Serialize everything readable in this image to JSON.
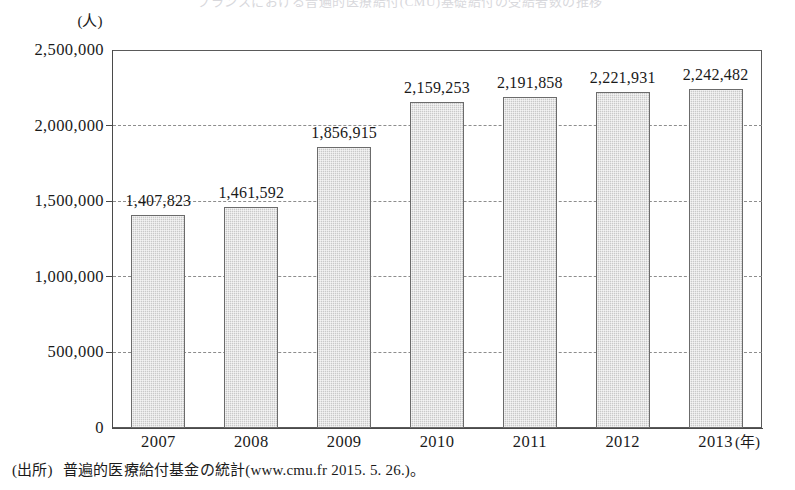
{
  "figure": {
    "title_cut_off": "フランスにおける普遍的医療給付(CMU)基礎給付の受給者数の推移",
    "y_unit_label": "(人)",
    "x_unit_label": "(年)",
    "source_note": {
      "label": "(出所)",
      "text": "普遍的医療給付基金の統計(www.cmu.fr  2015. 5. 26.)。"
    }
  },
  "chart_data": {
    "type": "bar",
    "title": "フランスにおける普遍的医療給付(CMU)基礎給付の受給者数の推移",
    "xlabel": "(年)",
    "ylabel": "(人)",
    "categories": [
      "2007",
      "2008",
      "2009",
      "2010",
      "2011",
      "2012",
      "2013"
    ],
    "values": [
      1407823,
      1461592,
      1856915,
      2159253,
      2191858,
      2221931,
      2242482
    ],
    "value_labels": [
      "1,407,823",
      "1,461,592",
      "1,856,915",
      "2,159,253",
      "2,191,858",
      "2,221,931",
      "2,242,482"
    ],
    "ylim": [
      0,
      2500000
    ],
    "ytick_values": [
      0,
      500000,
      1000000,
      1500000,
      2000000,
      2500000
    ],
    "ytick_labels": [
      "0",
      "500,000",
      "1,000,000",
      "1,500,000",
      "2,000,000",
      "2,500,000"
    ],
    "grid": true,
    "grid_style": "dashed-horizontal",
    "legend": "none",
    "bar_fill_color": "#c9c9c9",
    "bar_edge_color": "#6b6b6b",
    "axis_color": "#4a4a4a",
    "grid_color": "#8d8d8d"
  }
}
